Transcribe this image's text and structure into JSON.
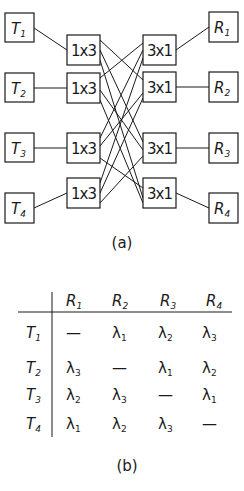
{
  "figure_a": {
    "caption": "(a)",
    "transmitters": [
      {
        "label": "T",
        "sub": "1"
      },
      {
        "label": "T",
        "sub": "2"
      },
      {
        "label": "T",
        "sub": "3"
      },
      {
        "label": "T",
        "sub": "4"
      }
    ],
    "splitters": [
      {
        "label": "1x3"
      },
      {
        "label": "1x3"
      },
      {
        "label": "1x3"
      },
      {
        "label": "1x3"
      }
    ],
    "combiners": [
      {
        "label": "3x1"
      },
      {
        "label": "3x1"
      },
      {
        "label": "3x1"
      },
      {
        "label": "3x1"
      }
    ],
    "receivers": [
      {
        "label": "R",
        "sub": "1"
      },
      {
        "label": "R",
        "sub": "2"
      },
      {
        "label": "R",
        "sub": "3"
      },
      {
        "label": "R",
        "sub": "4"
      }
    ]
  },
  "figure_b": {
    "caption": "(b)",
    "columns": [
      {
        "label": "R",
        "sub": "1"
      },
      {
        "label": "R",
        "sub": "2"
      },
      {
        "label": "R",
        "sub": "3"
      },
      {
        "label": "R",
        "sub": "4"
      }
    ],
    "rows": [
      {
        "label": "T",
        "sub": "1",
        "cells": [
          {
            "sym": "—",
            "sub": ""
          },
          {
            "sym": "λ",
            "sub": "1"
          },
          {
            "sym": "λ",
            "sub": "2"
          },
          {
            "sym": "λ",
            "sub": "3"
          }
        ]
      },
      {
        "label": "T",
        "sub": "2",
        "cells": [
          {
            "sym": "λ",
            "sub": "3"
          },
          {
            "sym": "—",
            "sub": ""
          },
          {
            "sym": "λ",
            "sub": "1"
          },
          {
            "sym": "λ",
            "sub": "2"
          }
        ]
      },
      {
        "label": "T",
        "sub": "3",
        "cells": [
          {
            "sym": "λ",
            "sub": "2"
          },
          {
            "sym": "λ",
            "sub": "3"
          },
          {
            "sym": "—",
            "sub": ""
          },
          {
            "sym": "λ",
            "sub": "1"
          }
        ]
      },
      {
        "label": "T",
        "sub": "4",
        "cells": [
          {
            "sym": "λ",
            "sub": "1"
          },
          {
            "sym": "λ",
            "sub": "2"
          },
          {
            "sym": "λ",
            "sub": "3"
          },
          {
            "sym": "—",
            "sub": ""
          }
        ]
      }
    ]
  }
}
